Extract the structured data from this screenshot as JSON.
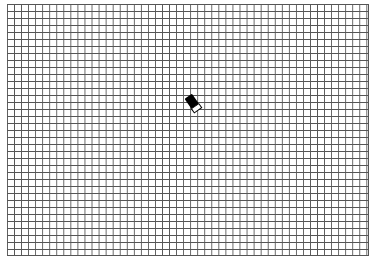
{
  "canvas": {
    "type": "grid-paper",
    "grid_color": "#555555",
    "background_color": "#ffffff",
    "cell_size_px": 7
  },
  "cursor": {
    "tool": "eraser-icon",
    "x": 185,
    "y": 113
  }
}
